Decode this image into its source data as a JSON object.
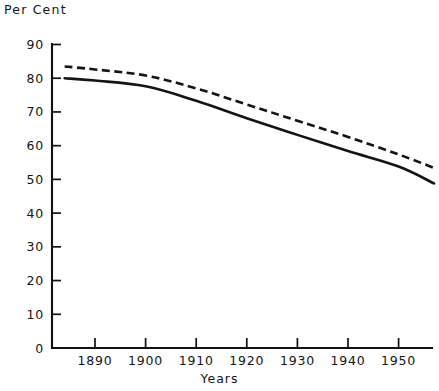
{
  "chart_data": {
    "type": "line",
    "title": "",
    "ylabel": "Per Cent",
    "xlabel": "Years",
    "xlim": [
      1884,
      1957
    ],
    "ylim": [
      0,
      90
    ],
    "grid": false,
    "legend": "none",
    "y_ticks": [
      0,
      10,
      20,
      30,
      40,
      50,
      60,
      70,
      80,
      90
    ],
    "y_tick_labels": [
      "0",
      "10",
      "20",
      "30",
      "40",
      "50",
      "60",
      "70",
      "80",
      "90"
    ],
    "x_ticks": [
      1890,
      1900,
      1910,
      1920,
      1930,
      1940,
      1950
    ],
    "x_tick_labels": [
      "1890",
      "1900",
      "1910",
      "1920",
      "1930",
      "1940",
      "1950"
    ],
    "x": [
      1884,
      1890,
      1900,
      1910,
      1920,
      1930,
      1940,
      1950,
      1957
    ],
    "series": [
      {
        "name": "dashed-upper",
        "style": "dashed",
        "values": [
          83.5,
          82.6,
          80.8,
          77.0,
          72.2,
          67.4,
          62.6,
          57.4,
          53.4
        ]
      },
      {
        "name": "solid-lower",
        "style": "solid",
        "values": [
          80.0,
          79.3,
          77.6,
          73.3,
          68.1,
          63.2,
          58.4,
          53.8,
          48.8
        ]
      }
    ],
    "annotations": []
  }
}
